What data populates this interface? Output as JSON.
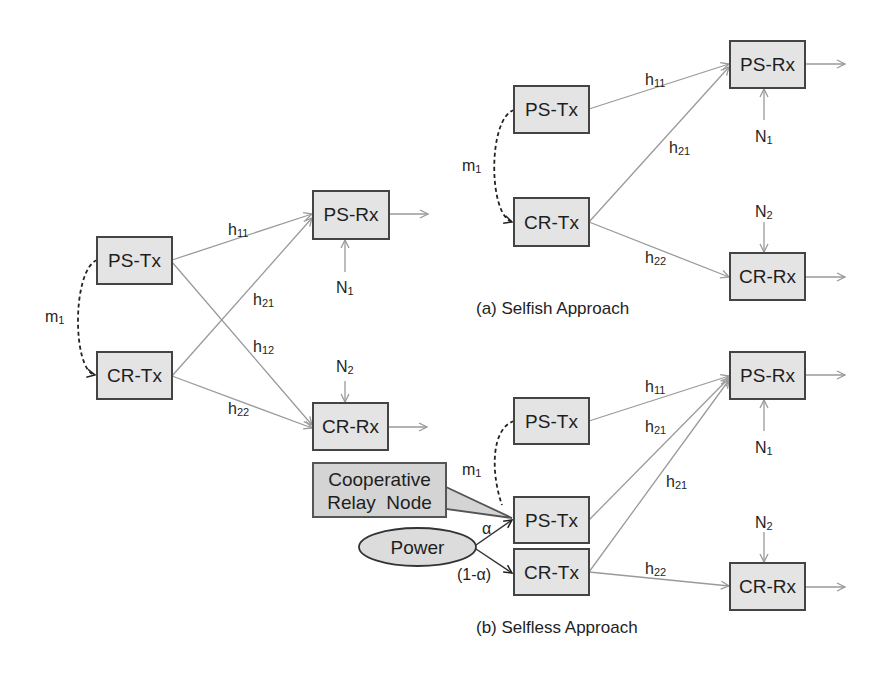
{
  "figure": {
    "colors": {
      "node_fill": "#e4e4e4",
      "node_stroke": "#444444",
      "link": "#9a9a9a",
      "text": "#1e1e1e"
    },
    "panels": {
      "base": {
        "nodes": {
          "ps_tx": "PS-Tx",
          "cr_tx": "CR-Tx",
          "ps_rx": "PS-Rx",
          "cr_rx": "CR-Rx"
        },
        "edges": {
          "h11": {
            "base": "h",
            "sub": "11"
          },
          "h21": {
            "base": "h",
            "sub": "21"
          },
          "h12": {
            "base": "h",
            "sub": "12"
          },
          "h22": {
            "base": "h",
            "sub": "22"
          },
          "m1": {
            "base": "m",
            "sub": "1"
          }
        },
        "noise": {
          "n1": {
            "base": "N",
            "sub": "1"
          },
          "n2": {
            "base": "N",
            "sub": "2"
          }
        }
      },
      "selfish": {
        "caption": "(a) Selfish Approach",
        "nodes": {
          "ps_tx": "PS-Tx",
          "cr_tx": "CR-Tx",
          "ps_rx": "PS-Rx",
          "cr_rx": "CR-Rx"
        },
        "edges": {
          "h11": {
            "base": "h",
            "sub": "11"
          },
          "h21": {
            "base": "h",
            "sub": "21"
          },
          "h22": {
            "base": "h",
            "sub": "22"
          },
          "m1": {
            "base": "m",
            "sub": "1"
          }
        },
        "noise": {
          "n1": {
            "base": "N",
            "sub": "1"
          },
          "n2": {
            "base": "N",
            "sub": "2"
          }
        }
      },
      "selfless": {
        "caption": "(b) Selfless Approach",
        "nodes": {
          "ps_tx": "PS-Tx",
          "relay_ps_tx": "PS-Tx",
          "cr_tx": "CR-Tx",
          "ps_rx": "PS-Rx",
          "cr_rx": "CR-Rx"
        },
        "edges": {
          "h11": {
            "base": "h",
            "sub": "11"
          },
          "h21_a": {
            "base": "h",
            "sub": "21"
          },
          "h21_b": {
            "base": "h",
            "sub": "21"
          },
          "h22": {
            "base": "h",
            "sub": "22"
          },
          "m1": {
            "base": "m",
            "sub": "1"
          }
        },
        "noise": {
          "n1": {
            "base": "N",
            "sub": "1"
          },
          "n2": {
            "base": "N",
            "sub": "2"
          }
        },
        "callout": {
          "line1": "Cooperative",
          "line2": "Relay  Node"
        },
        "power": {
          "label": "Power",
          "alpha": "α",
          "one_minus_alpha": "(1-α)"
        }
      }
    }
  }
}
